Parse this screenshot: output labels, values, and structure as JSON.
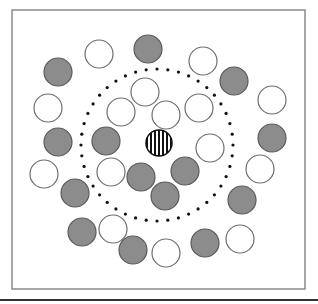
{
  "diagram": {
    "type": "particle-arrangement",
    "frame": {
      "x": 12,
      "y": 10,
      "width": 293,
      "height": 279,
      "stroke": "#8a8a8a"
    },
    "baseline": {
      "y": 300,
      "stroke": "#333333"
    },
    "ring": {
      "cx": 157,
      "cy": 145,
      "r": 76,
      "dot_color": "#111111",
      "dot_count": 44,
      "dot_radius": 1.6
    },
    "colors": {
      "gray_fill": "#8c8c8c",
      "gray_stroke": "#5a5a5a",
      "white_fill": "#ffffff",
      "white_stroke": "#6e6e6e",
      "stripe": "#111111"
    },
    "circle_radius": 14,
    "center_particle": {
      "cx": 159,
      "cy": 143,
      "r": 13,
      "style": "striped",
      "stripes": 7
    },
    "circles": [
      {
        "cx": 99,
        "cy": 54,
        "kind": "white"
      },
      {
        "cx": 148,
        "cy": 49,
        "kind": "gray"
      },
      {
        "cx": 203,
        "cy": 61,
        "kind": "white"
      },
      {
        "cx": 58,
        "cy": 72,
        "kind": "gray"
      },
      {
        "cx": 234,
        "cy": 81,
        "kind": "gray"
      },
      {
        "cx": 272,
        "cy": 100,
        "kind": "white"
      },
      {
        "cx": 48,
        "cy": 108,
        "kind": "white"
      },
      {
        "cx": 145,
        "cy": 92,
        "kind": "white"
      },
      {
        "cx": 121,
        "cy": 112,
        "kind": "white"
      },
      {
        "cx": 166,
        "cy": 115,
        "kind": "white"
      },
      {
        "cx": 199,
        "cy": 108,
        "kind": "white"
      },
      {
        "cx": 58,
        "cy": 142,
        "kind": "gray"
      },
      {
        "cx": 106,
        "cy": 141,
        "kind": "gray"
      },
      {
        "cx": 210,
        "cy": 148,
        "kind": "white"
      },
      {
        "cx": 272,
        "cy": 138,
        "kind": "gray"
      },
      {
        "cx": 44,
        "cy": 174,
        "kind": "white"
      },
      {
        "cx": 111,
        "cy": 172,
        "kind": "white"
      },
      {
        "cx": 141,
        "cy": 177,
        "kind": "gray"
      },
      {
        "cx": 185,
        "cy": 171,
        "kind": "gray"
      },
      {
        "cx": 165,
        "cy": 196,
        "kind": "gray"
      },
      {
        "cx": 260,
        "cy": 169,
        "kind": "white"
      },
      {
        "cx": 75,
        "cy": 193,
        "kind": "gray"
      },
      {
        "cx": 242,
        "cy": 200,
        "kind": "gray"
      },
      {
        "cx": 82,
        "cy": 232,
        "kind": "gray"
      },
      {
        "cx": 113,
        "cy": 229,
        "kind": "white"
      },
      {
        "cx": 133,
        "cy": 250,
        "kind": "gray"
      },
      {
        "cx": 166,
        "cy": 253,
        "kind": "white"
      },
      {
        "cx": 205,
        "cy": 243,
        "kind": "gray"
      },
      {
        "cx": 240,
        "cy": 239,
        "kind": "white"
      }
    ]
  }
}
